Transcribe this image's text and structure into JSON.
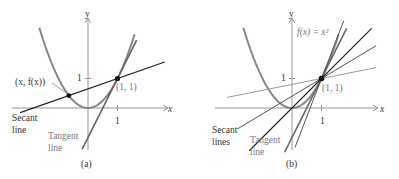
{
  "panels": [
    {
      "id": "a",
      "caption": "(a)",
      "x_axis_label": "x",
      "y_axis_label": "y",
      "x_tick_label": "1",
      "y_tick_label": "1",
      "point_label": "(1, 1)",
      "moving_point_label": "(x, f(x))",
      "secant_label_line1": "Secant",
      "secant_label_line2": "line",
      "tangent_label_line1": "Tangent",
      "tangent_label_line2": "line",
      "moving_point_x": -0.65
    },
    {
      "id": "b",
      "caption": "(b)",
      "x_axis_label": "x",
      "y_axis_label": "y",
      "x_tick_label": "1",
      "y_tick_label": "1",
      "point_label": "(1, 1)",
      "function_label": "f(x) = x²",
      "secant_label_line1": "Secant",
      "secant_label_line2": "lines",
      "tangent_label_line1": "Tangent",
      "tangent_label_line2": "line",
      "secant_x_values": [
        -0.8,
        -0.4,
        0.0
      ]
    }
  ]
}
